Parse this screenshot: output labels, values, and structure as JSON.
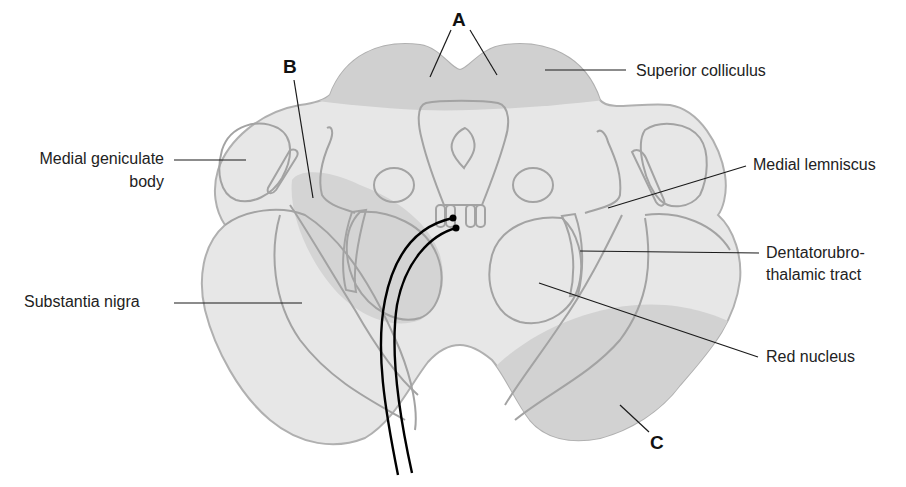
{
  "diagram": {
    "colors": {
      "background": "#ffffff",
      "tissue_fill": "#e6e6e6",
      "tissue_light": "#ececec",
      "shaded_region": "#d2d2d2",
      "outline": "#a3a3a3",
      "leader_line": "#1a1a1a",
      "electrode": "#000000"
    },
    "labels": {
      "superior_colliculus": "Superior colliculus",
      "medial_geniculate_line1": "Medial geniculate",
      "medial_geniculate_line2": "body",
      "medial_lemniscus": "Medial lemniscus",
      "dentatorubro_line1": "Dentatorubro-",
      "dentatorubro_line2": "thalamic tract",
      "substantia_nigra": "Substantia nigra",
      "red_nucleus": "Red nucleus"
    },
    "markers": {
      "a": "A",
      "b": "B",
      "c": "C"
    }
  }
}
